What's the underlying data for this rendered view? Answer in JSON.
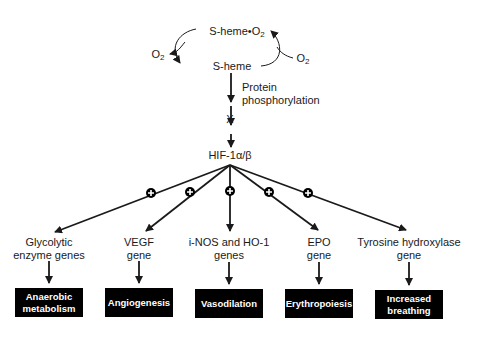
{
  "diagram": {
    "top_cycle": {
      "oxy": "S-heme•O",
      "oxy_sub": "2",
      "deoxy": "S-heme",
      "o2_left": "O",
      "o2_left_sub": "2",
      "o2_right": "O",
      "o2_right_sub": "2"
    },
    "step1_label_line1": "Protein",
    "step1_label_line2": "phosphorylation",
    "intermediate": "X",
    "hif": "HIF-1α/β",
    "plus_symbol": "+",
    "genes": [
      {
        "line1": "Glycolytic",
        "line2": "enzyme genes"
      },
      {
        "line1": "VEGF",
        "line2": "gene"
      },
      {
        "line1": "i-NOS and HO-1",
        "line2": "genes"
      },
      {
        "line1": "EPO",
        "line2": "gene"
      },
      {
        "line1": "Tyrosine hydroxylase",
        "line2": "gene"
      }
    ],
    "outcomes": [
      {
        "line1": "Anaerobic",
        "line2": "metabolism"
      },
      {
        "line1": "Angiogenesis",
        "line2": ""
      },
      {
        "line1": "Vasodilation",
        "line2": ""
      },
      {
        "line1": "Erythropoiesis",
        "line2": ""
      },
      {
        "line1": "Increased",
        "line2": "breathing"
      }
    ],
    "colors": {
      "line": "#1a1a1a",
      "box_bg": "#000000",
      "box_text": "#ffffff"
    }
  }
}
